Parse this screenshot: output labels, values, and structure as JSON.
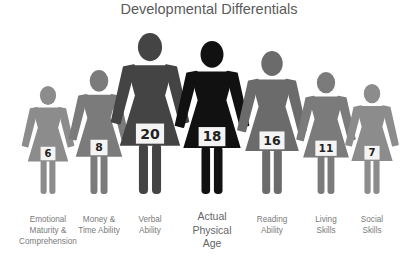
{
  "title": "Developmental Differentials",
  "figures": [
    {
      "label": "Emotional\nMaturity &\nComprehension",
      "value": "6",
      "color": "#8c8c8c",
      "cx": 48,
      "top": 86,
      "scale": 0.62
    },
    {
      "label": "Money &\nTime Ability",
      "value": "8",
      "color": "#7b7b7b",
      "cx": 99,
      "top": 70,
      "scale": 0.72
    },
    {
      "label": "Verbal\nAbility",
      "value": "20",
      "color": "#444444",
      "cx": 150,
      "top": 33,
      "scale": 0.97
    },
    {
      "label": "Actual\nPhysical\nAge",
      "value": "18",
      "color": "#111111",
      "cx": 212,
      "top": 41,
      "scale": 0.92
    },
    {
      "label": "Reading\nAbility",
      "value": "16",
      "color": "#6b6b6b",
      "cx": 272,
      "top": 51,
      "scale": 0.86
    },
    {
      "label": "Living\nSkills",
      "value": "11",
      "color": "#7b7b7b",
      "cx": 326,
      "top": 72,
      "scale": 0.72
    },
    {
      "label": "Social\nSkills",
      "value": "7",
      "color": "#8c8c8c",
      "cx": 372,
      "top": 84,
      "scale": 0.64
    }
  ],
  "chart_data": {
    "type": "pictograph",
    "title": "Developmental Differentials",
    "categories": [
      "Emotional Maturity & Comprehension",
      "Money & Time Ability",
      "Verbal Ability",
      "Actual Physical Age",
      "Reading Ability",
      "Living Skills",
      "Social Skills"
    ],
    "values": [
      6,
      8,
      20,
      18,
      16,
      11,
      7
    ],
    "unit": "years (developmental age)",
    "highlight": "Actual Physical Age"
  }
}
